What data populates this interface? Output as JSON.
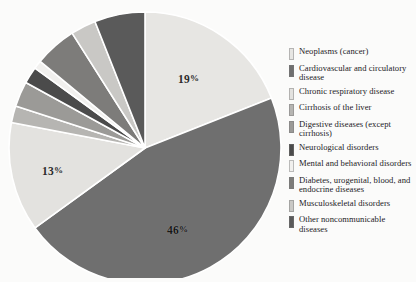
{
  "chart_data": {
    "type": "pie",
    "title": "",
    "subtitle": "",
    "xlabel": "",
    "ylabel": "",
    "legend_position": "right",
    "grid": false,
    "units": "percent",
    "categories": [
      "Neoplasms (cancer)",
      "Cardiovascular and circulatory disease",
      "Chronic respiratory disease",
      "Cirrhosis of the liver",
      "Digestive diseases (except cirrhosis)",
      "Neurological disorders",
      "Mental and behavioral disorders",
      "Diabetes, urogenital, blood, and endocrine diseases",
      "Musculoskeletal disorders",
      "Other noncommunicable diseases"
    ],
    "values": [
      19,
      46,
      13,
      2,
      3,
      2,
      1,
      5,
      3,
      6
    ],
    "labeled_values": [
      "19%",
      "46%",
      "13%"
    ],
    "colors": [
      "#e7e6e3",
      "#6f6f6f",
      "#e3e2df",
      "#b6b5b2",
      "#9b9a97",
      "#4b4b4b",
      "#f1f0ee",
      "#7d7c7a",
      "#c9c8c5",
      "#5a5a5a"
    ],
    "slices": [
      {
        "label": "Neoplasms (cancer)",
        "value": 19,
        "display": "19%",
        "color": "#e7e6e3",
        "start_deg": 0,
        "end_deg": 68.4,
        "value_shown": true
      },
      {
        "label": "Cardiovascular and circulatory disease",
        "value": 46,
        "display": "46%",
        "color": "#6f6f6f",
        "start_deg": 68.4,
        "end_deg": 234.0,
        "value_shown": true
      },
      {
        "label": "Chronic respiratory disease",
        "value": 13,
        "display": "13%",
        "color": "#e3e2df",
        "start_deg": 234.0,
        "end_deg": 280.8,
        "value_shown": true
      },
      {
        "label": "Cirrhosis of the liver",
        "value": 2,
        "display": "",
        "color": "#b6b5b2",
        "start_deg": 280.8,
        "end_deg": 288.0,
        "value_shown": false
      },
      {
        "label": "Digestive diseases (except cirrhosis)",
        "value": 3,
        "display": "",
        "color": "#9b9a97",
        "start_deg": 288.0,
        "end_deg": 298.8,
        "value_shown": false
      },
      {
        "label": "Neurological disorders",
        "value": 2,
        "display": "",
        "color": "#4b4b4b",
        "start_deg": 298.8,
        "end_deg": 306.0,
        "value_shown": false
      },
      {
        "label": "Mental and behavioral disorders",
        "value": 1,
        "display": "",
        "color": "#f1f0ee",
        "start_deg": 306.0,
        "end_deg": 309.6,
        "value_shown": false
      },
      {
        "label": "Diabetes, urogenital, blood, and endocrine diseases",
        "value": 5,
        "display": "",
        "color": "#7d7c7a",
        "start_deg": 309.6,
        "end_deg": 327.6,
        "value_shown": false
      },
      {
        "label": "Musculoskeletal disorders",
        "value": 3,
        "display": "",
        "color": "#c9c8c5",
        "start_deg": 327.6,
        "end_deg": 338.4,
        "value_shown": false
      },
      {
        "label": "Other noncommunicable diseases",
        "value": 6,
        "display": "",
        "color": "#5a5a5a",
        "start_deg": 338.4,
        "end_deg": 360.0,
        "value_shown": false
      }
    ]
  },
  "pie": {
    "center_x": 137,
    "center_y": 142,
    "radius": 136,
    "separator_color": "#ffffff",
    "separator_width": 1.6,
    "labels": [
      {
        "id": "neoplasms",
        "text": "19",
        "suffix": "%"
      },
      {
        "id": "respiratory",
        "text": "13",
        "suffix": "%"
      },
      {
        "id": "cardio",
        "text": "46",
        "suffix": "%"
      }
    ]
  },
  "legend": {
    "items": [
      {
        "label": "Neoplasms (cancer)",
        "color": "#e7e6e3"
      },
      {
        "label": "Cardiovascular and circulatory disease",
        "color": "#6f6f6f"
      },
      {
        "label": "Chronic respiratory disease",
        "color": "#e3e2df"
      },
      {
        "label": "Cirrhosis of the liver",
        "color": "#b6b5b2"
      },
      {
        "label": "Digestive diseases (except cirrhosis)",
        "color": "#9b9a97"
      },
      {
        "label": "Neurological disorders",
        "color": "#4b4b4b"
      },
      {
        "label": "Mental and behavioral disorders",
        "color": "#f1f0ee"
      },
      {
        "label": "Diabetes, urogenital, blood, and endocrine diseases",
        "color": "#7d7c7a"
      },
      {
        "label": "Musculoskeletal disorders",
        "color": "#c9c8c5"
      },
      {
        "label": "Other noncommunicable diseases",
        "color": "#5a5a5a"
      }
    ]
  }
}
